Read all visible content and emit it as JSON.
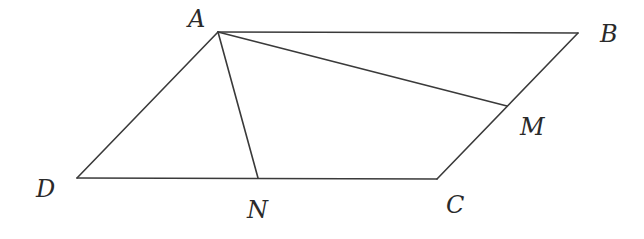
{
  "figure": {
    "type": "parallelogram",
    "points": {
      "A": {
        "label": "A",
        "x": 218,
        "y": 32,
        "lx": 188,
        "ly": 27
      },
      "B": {
        "label": "B",
        "x": 578,
        "y": 33,
        "lx": 600,
        "ly": 42
      },
      "C": {
        "label": "C",
        "x": 437,
        "y": 179,
        "lx": 446,
        "ly": 213
      },
      "D": {
        "label": "D",
        "x": 77,
        "y": 178,
        "lx": 36,
        "ly": 197
      },
      "M": {
        "label": "M",
        "x": 507,
        "y": 106,
        "lx": 520,
        "ly": 135
      },
      "N": {
        "label": "N",
        "x": 258,
        "y": 178,
        "lx": 247,
        "ly": 218
      }
    },
    "segments": [
      {
        "name": "segment-ab",
        "from": "A",
        "to": "B"
      },
      {
        "name": "segment-bc",
        "from": "B",
        "to": "C"
      },
      {
        "name": "segment-cd",
        "from": "C",
        "to": "D"
      },
      {
        "name": "segment-da",
        "from": "D",
        "to": "A"
      },
      {
        "name": "segment-am",
        "from": "A",
        "to": "M"
      },
      {
        "name": "segment-an",
        "from": "A",
        "to": "N"
      }
    ],
    "stroke_color": "#3a3a3a",
    "label_color": "#2a2a2a"
  }
}
